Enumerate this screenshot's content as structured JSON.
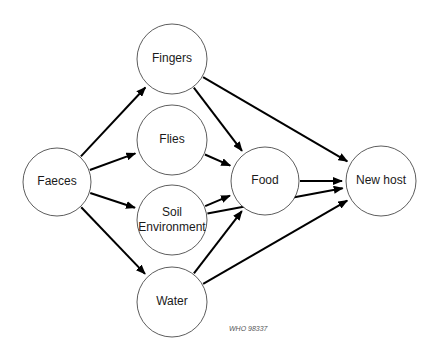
{
  "diagram": {
    "nodes": [
      {
        "id": "faeces",
        "label": "Faeces",
        "cx": 57,
        "cy": 182,
        "r": 34
      },
      {
        "id": "fingers",
        "label": "Fingers",
        "cx": 172,
        "cy": 59,
        "r": 35
      },
      {
        "id": "flies",
        "label": "Flies",
        "cx": 172,
        "cy": 140,
        "r": 35
      },
      {
        "id": "soil",
        "label": "Soil",
        "label2": "Environment",
        "cx": 172,
        "cy": 220,
        "r": 35
      },
      {
        "id": "water",
        "label": "Water",
        "cx": 172,
        "cy": 302,
        "r": 35
      },
      {
        "id": "food",
        "label": "Food",
        "cx": 265,
        "cy": 181,
        "r": 34
      },
      {
        "id": "newhost",
        "label": "New host",
        "cx": 381,
        "cy": 181,
        "r": 35
      }
    ],
    "edges": [
      {
        "from": "faeces",
        "to": "fingers"
      },
      {
        "from": "faeces",
        "to": "flies"
      },
      {
        "from": "faeces",
        "to": "soil"
      },
      {
        "from": "faeces",
        "to": "water"
      },
      {
        "from": "fingers",
        "to": "food"
      },
      {
        "from": "fingers",
        "to": "newhost"
      },
      {
        "from": "flies",
        "to": "food"
      },
      {
        "from": "soil",
        "to": "food"
      },
      {
        "from": "soil",
        "to": "newhost"
      },
      {
        "from": "water",
        "to": "food"
      },
      {
        "from": "water",
        "to": "newhost"
      },
      {
        "from": "food",
        "to": "newhost"
      }
    ],
    "credit": "WHO 98337"
  }
}
